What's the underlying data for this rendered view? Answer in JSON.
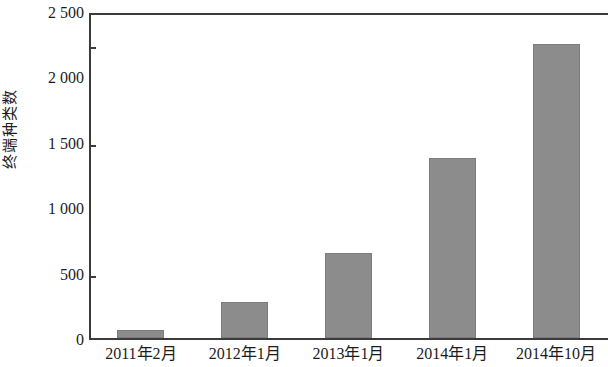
{
  "chart_data": {
    "type": "bar",
    "title": "",
    "xlabel": "",
    "ylabel": "终端种类数",
    "categories": [
      "2011年2月",
      "2012年1月",
      "2013年1月",
      "2014年1月",
      "2014年10月"
    ],
    "values": [
      60,
      275,
      650,
      1380,
      2250
    ],
    "ylim": [
      0,
      2500
    ],
    "yticks": [
      0,
      500,
      1000,
      1500,
      2000,
      2500
    ],
    "ytick_labels": [
      "0",
      "500",
      "1 000",
      "1 500",
      "2 000",
      "2 500"
    ],
    "grid": false,
    "legend": false,
    "series": [
      {
        "name": "终端种类数",
        "values": [
          60,
          275,
          650,
          1380,
          2250
        ]
      }
    ],
    "colors": {
      "bar_fill": "#8c8c8c",
      "bar_edge": "#7d7d7d",
      "axis": "#3b3b3b",
      "text": "#1c1c1c",
      "background": "#ffffff"
    }
  }
}
